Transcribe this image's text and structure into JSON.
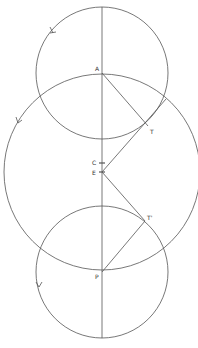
{
  "diagram": {
    "colors": {
      "stroke": "#555555",
      "label": "#333333",
      "background": "#ffffff"
    },
    "points": {
      "A": {
        "label": "A",
        "x": 102,
        "y": 73
      },
      "T": {
        "label": "T",
        "x": 148,
        "y": 126
      },
      "C": {
        "label": "C",
        "x": 102,
        "y": 163
      },
      "E": {
        "label": "E",
        "x": 102,
        "y": 172
      },
      "T2": {
        "label": "T'",
        "x": 145,
        "y": 221
      },
      "P": {
        "label": "P",
        "x": 102,
        "y": 272
      }
    },
    "circles": [
      {
        "name": "top-circle",
        "center": "A",
        "r": 66
      },
      {
        "name": "large-circle",
        "center": "E",
        "r": 98
      },
      {
        "name": "bottom-circle",
        "center": "P",
        "r": 66
      }
    ],
    "arrows": [
      "top-circle direction arrow",
      "large-circle direction arrow",
      "bottom-circle direction arrow"
    ]
  }
}
